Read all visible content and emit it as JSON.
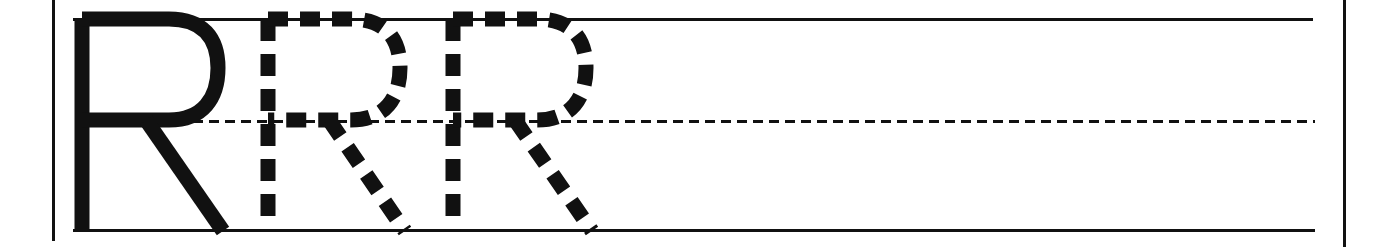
{
  "worksheet": {
    "type": "handwriting-practice-row",
    "letter": "R",
    "letter_case": "uppercase",
    "title": "Letter R tracing practice row",
    "canvas": {
      "width": 1388,
      "height": 247,
      "background": "#ffffff"
    },
    "ink_color": "#111111",
    "rules": {
      "top_line": {
        "label": "top line",
        "style": "solid",
        "x_start": 73,
        "x_end": 1313,
        "y": 18,
        "thickness": 3
      },
      "middle_line": {
        "label": "dotted midline",
        "style": "dashed",
        "x_start": 193,
        "x_end": 1315,
        "y": 120,
        "thickness": 3,
        "dash": 10,
        "gap": 6
      },
      "bottom_line": {
        "label": "baseline",
        "style": "solid",
        "x_start": 73,
        "x_end": 1315,
        "y": 229,
        "thickness": 3
      },
      "left_margin": {
        "label": "left margin rule",
        "x": 52,
        "y_start": 0,
        "y_end": 241,
        "thickness": 3
      },
      "right_margin": {
        "label": "right margin rule",
        "x": 1343,
        "y_start": 0,
        "y_end": 247,
        "thickness": 3
      }
    },
    "letters": [
      {
        "character": "R",
        "render": "solid",
        "label": "model letter R",
        "order": 1,
        "x": 73,
        "width": 162
      },
      {
        "character": "R",
        "render": "dashed",
        "label": "tracing letter R",
        "order": 2,
        "x": 259,
        "width": 156
      },
      {
        "character": "R",
        "render": "dashed",
        "label": "tracing letter R",
        "order": 3,
        "x": 444,
        "width": 158
      }
    ],
    "blank_space": {
      "label": "blank practice space",
      "x_start": 610,
      "x_end": 1315
    }
  }
}
